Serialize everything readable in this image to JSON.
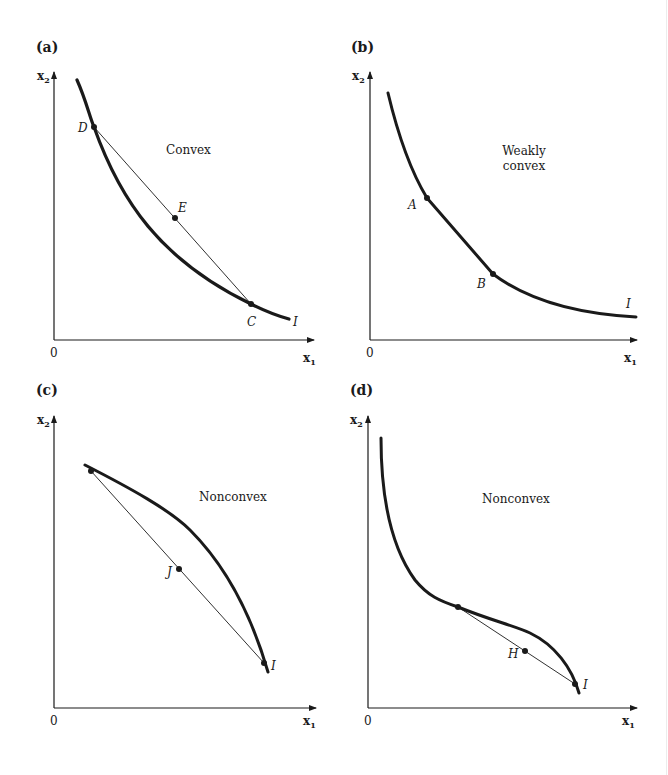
{
  "figure": {
    "colors": {
      "ink": "#1a1a1a",
      "background": "#ffffff"
    },
    "panels": [
      {
        "id": "a",
        "label": "(a)",
        "region_label": "Convex",
        "axes": {
          "x": "x",
          "x_sub": "1",
          "y": "x",
          "y_sub": "2",
          "origin": "0"
        },
        "curve_label": "I",
        "points": [
          {
            "name": "D"
          },
          {
            "name": "E"
          },
          {
            "name": "C"
          }
        ]
      },
      {
        "id": "b",
        "label": "(b)",
        "region_label_line1": "Weakly",
        "region_label_line2": "convex",
        "axes": {
          "x": "x",
          "x_sub": "1",
          "y": "x",
          "y_sub": "2",
          "origin": "0"
        },
        "curve_label": "I",
        "points": [
          {
            "name": "A"
          },
          {
            "name": "B"
          }
        ]
      },
      {
        "id": "c",
        "label": "(c)",
        "region_label": "Nonconvex",
        "axes": {
          "x": "x",
          "x_sub": "1",
          "y": "x",
          "y_sub": "2",
          "origin": "0"
        },
        "curve_label": "I",
        "points": [
          {
            "name": "J"
          }
        ]
      },
      {
        "id": "d",
        "label": "(d)",
        "region_label": "Nonconvex",
        "axes": {
          "x": "x",
          "x_sub": "1",
          "y": "x",
          "y_sub": "2",
          "origin": "0"
        },
        "curve_label": "I",
        "points": [
          {
            "name": "H"
          }
        ]
      }
    ]
  }
}
